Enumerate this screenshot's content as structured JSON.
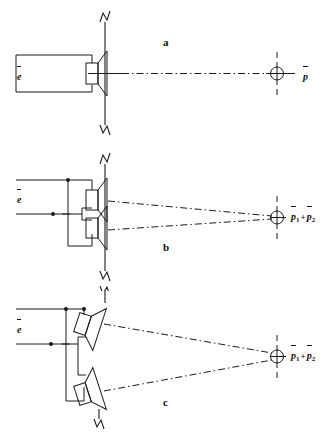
{
  "figure": {
    "ink_color": "#1a1a1a",
    "background": "#ffffff"
  },
  "panels": [
    {
      "id": "a",
      "letter": "a",
      "input_label": {
        "symbol": "e",
        "overbar": true,
        "subscript": ""
      },
      "output_terms": [
        {
          "symbol": "p",
          "overbar": true,
          "subscript": ""
        }
      ],
      "driver_count": 1,
      "driver_arrangement": "single on-axis driver",
      "baffle": "vertical line with zigzag break symbols top and bottom",
      "field_point_symbol": "circle-with-crosshair"
    },
    {
      "id": "b",
      "letter": "b",
      "input_label": {
        "symbol": "e",
        "overbar": true,
        "subscript": ""
      },
      "output_terms": [
        {
          "symbol": "p",
          "overbar": true,
          "subscript": "1"
        },
        {
          "symbol": "p",
          "overbar": true,
          "subscript": "2"
        }
      ],
      "output_operator": "+",
      "driver_count": 2,
      "driver_arrangement": "two parallel-wired drivers mounted flat on a common baffle",
      "baffle": "vertical line with zigzag break symbols top and bottom",
      "field_point_symbol": "circle-with-crosshair"
    },
    {
      "id": "c",
      "letter": "c",
      "input_label": {
        "symbol": "e",
        "overbar": true,
        "subscript": ""
      },
      "output_terms": [
        {
          "symbol": "p",
          "overbar": true,
          "subscript": "1"
        },
        {
          "symbol": "p",
          "overbar": true,
          "subscript": "2"
        }
      ],
      "output_operator": "+",
      "driver_count": 2,
      "driver_arrangement": "two parallel-wired drivers splayed/tilted outward toward the field point",
      "baffle": "vertical line with zigzag break symbol at bottom",
      "field_point_symbol": "circle-with-crosshair"
    }
  ]
}
